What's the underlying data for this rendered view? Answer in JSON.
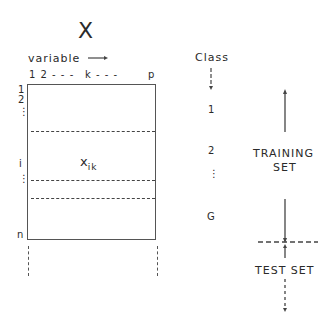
{
  "matrix": {
    "name": "X",
    "column_axis_label": "variable",
    "column_ticks": [
      "1 2 - - -",
      "k - - -",
      "p"
    ],
    "row_ticks": [
      "1",
      "2",
      "⋮",
      "i",
      "⋮",
      "n"
    ],
    "element_label": "x",
    "element_subscript": "ik"
  },
  "class_column": {
    "header": "Class",
    "labels": [
      "1",
      "2",
      "⋮",
      "G"
    ]
  },
  "sets": {
    "training": [
      "TRAINING",
      "SET"
    ],
    "test": "TEST SET"
  }
}
